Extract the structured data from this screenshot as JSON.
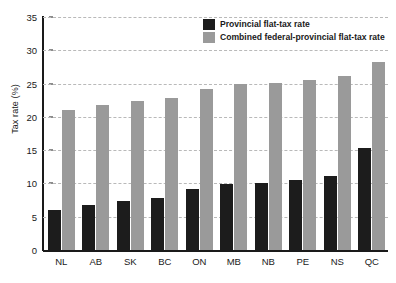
{
  "chart_data": {
    "type": "bar",
    "title": "",
    "xlabel": "",
    "ylabel": "Tax rate (%)",
    "ylim": [
      0,
      35
    ],
    "ytick_step": 5,
    "yticks": [
      0,
      5,
      10,
      15,
      20,
      25,
      30,
      35
    ],
    "grid": true,
    "legend_position": "top-right",
    "categories": [
      "NL",
      "AB",
      "SK",
      "BC",
      "ON",
      "MB",
      "NB",
      "PE",
      "NS",
      "QC"
    ],
    "series": [
      {
        "name": "Provincial flat-tax rate",
        "color": "#1c1c1c",
        "values": [
          6.0,
          6.8,
          7.4,
          7.8,
          9.2,
          9.9,
          10.1,
          10.5,
          11.1,
          15.3
        ]
      },
      {
        "name": "Combined federal-provincial flat-tax rate",
        "color": "#9a9a9a",
        "values": [
          21.0,
          21.8,
          22.4,
          22.8,
          24.2,
          24.9,
          25.1,
          25.5,
          26.1,
          28.3
        ]
      }
    ]
  },
  "colors": {
    "series_dark": "#1c1c1c",
    "series_gray": "#9a9a9a",
    "gridline": "#b9b9b9",
    "axis": "#1a1a1a",
    "background": "#ffffff"
  }
}
